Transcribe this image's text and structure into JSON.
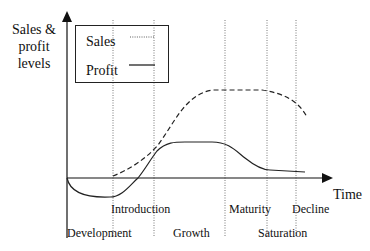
{
  "diagram": {
    "y_axis_label": "Sales & profit levels",
    "y_axis_label_lines": [
      "Sales &",
      "profit",
      "levels"
    ],
    "x_axis_label": "Time",
    "legend": [
      {
        "name": "Sales",
        "style": "dotted"
      },
      {
        "name": "Profit",
        "style": "solid"
      }
    ],
    "stages": [
      {
        "name": "Development"
      },
      {
        "name": "Introduction"
      },
      {
        "name": "Growth"
      },
      {
        "name": "Maturity"
      },
      {
        "name": "Saturation"
      },
      {
        "name": "Decline"
      }
    ],
    "curves": {
      "sales": {
        "style": "dashed",
        "description": "Begins at introduction near zero, rises through growth, plateaus during maturity and saturation, declines at decline stage"
      },
      "profit": {
        "style": "solid",
        "description": "Negative during development, crosses zero during introduction, peaks in growth, falls in maturity, flattens low in saturation/decline"
      }
    }
  }
}
